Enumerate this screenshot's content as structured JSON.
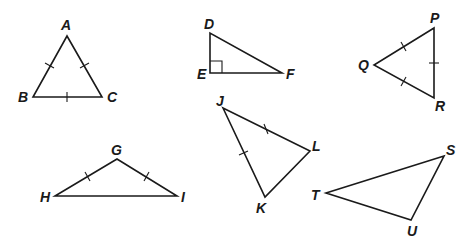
{
  "diagram": {
    "type": "geometry-triangles",
    "triangles": [
      {
        "name": "ABC",
        "classification": "equilateral",
        "vertices": {
          "A": {
            "x": 67,
            "y": 36,
            "label_x": 61,
            "label_y": 30
          },
          "B": {
            "x": 33,
            "y": 97,
            "label_x": 18,
            "label_y": 102
          },
          "C": {
            "x": 102,
            "y": 97,
            "label_x": 107,
            "label_y": 102
          }
        },
        "tick_marks": [
          "AB",
          "AC",
          "BC"
        ]
      },
      {
        "name": "DEF",
        "classification": "right",
        "vertices": {
          "D": {
            "x": 210,
            "y": 33,
            "label_x": 204,
            "label_y": 29
          },
          "E": {
            "x": 210,
            "y": 73,
            "label_x": 197,
            "label_y": 79
          },
          "F": {
            "x": 282,
            "y": 73,
            "label_x": 286,
            "label_y": 79
          }
        },
        "right_angle_at": "E"
      },
      {
        "name": "PQR",
        "classification": "equilateral",
        "vertices": {
          "P": {
            "x": 434,
            "y": 28,
            "label_x": 430,
            "label_y": 23
          },
          "Q": {
            "x": 374,
            "y": 65,
            "label_x": 358,
            "label_y": 70
          },
          "R": {
            "x": 434,
            "y": 98,
            "label_x": 435,
            "label_y": 111
          }
        },
        "tick_marks": [
          "PQ",
          "QR",
          "PR"
        ]
      },
      {
        "name": "GHI",
        "classification": "isosceles-obtuse",
        "vertices": {
          "G": {
            "x": 117,
            "y": 159,
            "label_x": 111,
            "label_y": 155
          },
          "H": {
            "x": 55,
            "y": 196,
            "label_x": 40,
            "label_y": 202
          },
          "I": {
            "x": 177,
            "y": 196,
            "label_x": 181,
            "label_y": 202
          }
        },
        "tick_marks": [
          "GH",
          "GI"
        ]
      },
      {
        "name": "JKL",
        "classification": "isosceles",
        "vertices": {
          "J": {
            "x": 223,
            "y": 108,
            "label_x": 216,
            "label_y": 106
          },
          "K": {
            "x": 265,
            "y": 197,
            "label_x": 256,
            "label_y": 213
          },
          "L": {
            "x": 310,
            "y": 151,
            "label_x": 312,
            "label_y": 151
          }
        },
        "tick_marks": [
          "JL",
          "JK"
        ]
      },
      {
        "name": "STU",
        "classification": "scalene-obtuse",
        "vertices": {
          "S": {
            "x": 444,
            "y": 156,
            "label_x": 446,
            "label_y": 155
          },
          "T": {
            "x": 326,
            "y": 193,
            "label_x": 311,
            "label_y": 200
          },
          "U": {
            "x": 411,
            "y": 220,
            "label_x": 407,
            "label_y": 236
          }
        },
        "tick_marks": []
      }
    ]
  },
  "labels": {
    "A": "A",
    "B": "B",
    "C": "C",
    "D": "D",
    "E": "E",
    "F": "F",
    "P": "P",
    "Q": "Q",
    "R": "R",
    "G": "G",
    "H": "H",
    "I": "I",
    "J": "J",
    "K": "K",
    "L": "L",
    "S": "S",
    "T": "T",
    "U": "U"
  }
}
